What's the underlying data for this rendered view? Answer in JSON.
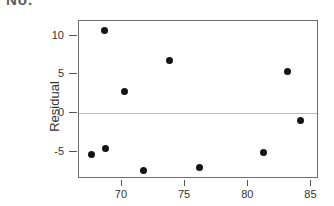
{
  "header": {
    "clipped_text": "No."
  },
  "chart_data": {
    "type": "scatter",
    "title": "",
    "subtitle": "",
    "xlabel": "",
    "ylabel": "Residual",
    "grid": false,
    "legend": null,
    "zero_reference_line": 0,
    "xlim": [
      66.6,
      85.6
    ],
    "ylim": [
      -8.5,
      11.9
    ],
    "xticks": [
      70,
      75,
      80,
      85
    ],
    "xtick_labels": [
      "70",
      "75",
      "80",
      "85"
    ],
    "yticks": [
      10,
      5,
      0,
      -5
    ],
    "ytick_labels": [
      "10",
      "5",
      "0",
      "-5"
    ],
    "marker": "filled-circle",
    "marker_color": "#141414",
    "points": [
      {
        "x": 67.6,
        "y": -5.4
      },
      {
        "x": 68.6,
        "y": 10.7
      },
      {
        "x": 68.7,
        "y": -4.6
      },
      {
        "x": 70.2,
        "y": 2.8
      },
      {
        "x": 71.7,
        "y": -7.4
      },
      {
        "x": 73.8,
        "y": 6.8
      },
      {
        "x": 76.1,
        "y": -7.0
      },
      {
        "x": 81.2,
        "y": -5.1
      },
      {
        "x": 83.1,
        "y": 5.4
      },
      {
        "x": 84.1,
        "y": -0.9
      }
    ]
  },
  "colors": {
    "frame": "#6d6d6d",
    "zero_line": "#b9bcbd",
    "marker": "#141414",
    "text": "#333333",
    "background": "#ffffff"
  }
}
